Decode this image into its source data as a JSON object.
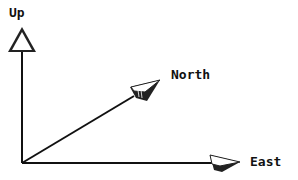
{
  "diagram": {
    "type": "3d-axes",
    "origin": [
      22,
      163
    ],
    "axes": [
      {
        "label": "Up",
        "direction": "vertical",
        "tip": [
          22,
          28
        ]
      },
      {
        "label": "North",
        "direction": "diagonal",
        "tip": [
          160,
          80
        ]
      },
      {
        "label": "East",
        "direction": "horizontal",
        "tip": [
          240,
          163
        ]
      }
    ],
    "colors": {
      "stroke": "#111111",
      "arrow_fill": "#ffffff",
      "arrow_shadow": "#222222",
      "background": "#ffffff"
    }
  },
  "labels": {
    "up": "Up",
    "north": "North",
    "east": "East"
  }
}
